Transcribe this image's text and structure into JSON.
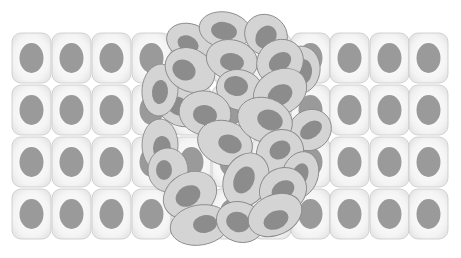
{
  "figure": {
    "background": "#ffffff",
    "colors": {
      "normal_cell_fill_center": "#ffffff",
      "normal_cell_fill_edge": "#e6e6e6",
      "normal_cell_stroke": "#c8c8c8",
      "normal_nucleus": "#9a9a9a",
      "tumor_cell_fill": "#d4d4d4",
      "tumor_cell_stroke": "#8a8a8a",
      "tumor_nucleus": "#8c8c8c"
    },
    "normal_grid": {
      "columns_x": [
        12,
        52,
        92,
        132,
        172,
        212,
        252,
        291,
        330,
        370,
        409
      ],
      "rows_y": [
        33,
        85,
        137,
        189
      ],
      "cell_width": 39,
      "cell_height": 50,
      "corner_radius": 9,
      "nucleus_rx": 12,
      "nucleus_ry": 15
    },
    "tumor_cells": [
      {
        "cx": 190,
        "cy": 42,
        "rx": 24,
        "ry": 18,
        "rot": 20,
        "nx": 188,
        "ny": 44,
        "nrx": 11,
        "nry": 8,
        "nrot": 25
      },
      {
        "cx": 225,
        "cy": 30,
        "rx": 26,
        "ry": 18,
        "rot": 10,
        "nx": 224,
        "ny": 31,
        "nrx": 13,
        "nry": 9,
        "nrot": 10
      },
      {
        "cx": 266,
        "cy": 35,
        "rx": 22,
        "ry": 20,
        "rot": 35,
        "nx": 266,
        "ny": 37,
        "nrx": 10,
        "nry": 12,
        "nrot": 35
      },
      {
        "cx": 300,
        "cy": 70,
        "rx": 20,
        "ry": 24,
        "rot": 10,
        "nx": 302,
        "ny": 72,
        "nrx": 10,
        "nry": 13,
        "nrot": 10
      },
      {
        "cx": 180,
        "cy": 105,
        "rx": 26,
        "ry": 20,
        "rot": 30,
        "nx": 178,
        "ny": 106,
        "nrx": 12,
        "nry": 9,
        "nrot": 30
      },
      {
        "cx": 160,
        "cy": 90,
        "rx": 18,
        "ry": 26,
        "rot": 5,
        "nx": 160,
        "ny": 92,
        "nrx": 8,
        "nry": 12,
        "nrot": 5
      },
      {
        "cx": 190,
        "cy": 70,
        "rx": 26,
        "ry": 21,
        "rot": 30,
        "nx": 184,
        "ny": 70,
        "nrx": 12,
        "nry": 10,
        "nrot": 30
      },
      {
        "cx": 232,
        "cy": 60,
        "rx": 26,
        "ry": 20,
        "rot": 15,
        "nx": 232,
        "ny": 62,
        "nrx": 12,
        "nry": 9,
        "nrot": 10
      },
      {
        "cx": 240,
        "cy": 90,
        "rx": 24,
        "ry": 20,
        "rot": 20,
        "nx": 236,
        "ny": 86,
        "nrx": 12,
        "nry": 10,
        "nrot": 10
      },
      {
        "cx": 280,
        "cy": 62,
        "rx": 24,
        "ry": 22,
        "rot": -35,
        "nx": 280,
        "ny": 62,
        "nrx": 12,
        "nry": 9,
        "nrot": -35
      },
      {
        "cx": 280,
        "cy": 92,
        "rx": 28,
        "ry": 22,
        "rot": -30,
        "nx": 280,
        "ny": 95,
        "nrx": 13,
        "nry": 10,
        "nrot": -30
      },
      {
        "cx": 310,
        "cy": 130,
        "rx": 22,
        "ry": 20,
        "rot": -35,
        "nx": 311,
        "ny": 130,
        "nrx": 12,
        "nry": 8,
        "nrot": -35
      },
      {
        "cx": 160,
        "cy": 145,
        "rx": 18,
        "ry": 26,
        "rot": 0,
        "nx": 162,
        "ny": 148,
        "nrx": 9,
        "nry": 12,
        "nrot": 0
      },
      {
        "cx": 205,
        "cy": 113,
        "rx": 26,
        "ry": 22,
        "rot": 10,
        "nx": 205,
        "ny": 115,
        "nrx": 12,
        "nry": 10,
        "nrot": 10
      },
      {
        "cx": 225,
        "cy": 143,
        "rx": 28,
        "ry": 22,
        "rot": 20,
        "nx": 230,
        "ny": 144,
        "nrx": 12,
        "nry": 9,
        "nrot": 20
      },
      {
        "cx": 265,
        "cy": 120,
        "rx": 28,
        "ry": 22,
        "rot": 20,
        "nx": 270,
        "ny": 120,
        "nrx": 13,
        "nry": 10,
        "nrot": 20
      },
      {
        "cx": 280,
        "cy": 152,
        "rx": 24,
        "ry": 22,
        "rot": -30,
        "nx": 280,
        "ny": 150,
        "nrx": 11,
        "nry": 9,
        "nrot": -30
      },
      {
        "cx": 300,
        "cy": 175,
        "rx": 18,
        "ry": 24,
        "rot": 20,
        "nx": 300,
        "ny": 175,
        "nrx": 8,
        "nry": 12,
        "nrot": 20
      },
      {
        "cx": 168,
        "cy": 170,
        "rx": 20,
        "ry": 22,
        "rot": 0,
        "nx": 164,
        "ny": 170,
        "nrx": 8,
        "nry": 10,
        "nrot": 0
      },
      {
        "cx": 190,
        "cy": 195,
        "rx": 28,
        "ry": 22,
        "rot": -30,
        "nx": 188,
        "ny": 196,
        "nrx": 13,
        "nry": 10,
        "nrot": -30
      },
      {
        "cx": 246,
        "cy": 180,
        "rx": 22,
        "ry": 28,
        "rot": 25,
        "nx": 244,
        "ny": 180,
        "nrx": 10,
        "nry": 14,
        "nrot": 25
      },
      {
        "cx": 283,
        "cy": 190,
        "rx": 24,
        "ry": 22,
        "rot": -30,
        "nx": 283,
        "ny": 190,
        "nrx": 12,
        "nry": 9,
        "nrot": -30
      },
      {
        "cx": 200,
        "cy": 225,
        "rx": 30,
        "ry": 20,
        "rot": -10,
        "nx": 205,
        "ny": 224,
        "nrx": 12,
        "nry": 9,
        "nrot": -10
      },
      {
        "cx": 240,
        "cy": 222,
        "rx": 24,
        "ry": 20,
        "rot": 20,
        "nx": 238,
        "ny": 222,
        "nrx": 12,
        "nry": 10,
        "nrot": 20
      },
      {
        "cx": 275,
        "cy": 215,
        "rx": 28,
        "ry": 20,
        "rot": -25,
        "nx": 276,
        "ny": 220,
        "nrx": 13,
        "nry": 9,
        "nrot": -25
      }
    ]
  }
}
